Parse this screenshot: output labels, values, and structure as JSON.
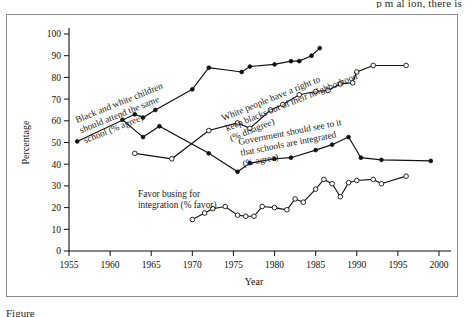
{
  "page": {
    "top_cutoff_text": "p      m  al    ion, there is",
    "bottom_cutoff_text": "Figure"
  },
  "figure": {
    "frame_label": "figure-frame"
  },
  "chart_data": {
    "type": "line",
    "title": "",
    "subtitle": "",
    "xlabel": "Year",
    "ylabel": "Percentage",
    "xlim": [
      1955,
      2000
    ],
    "ylim": [
      0,
      100
    ],
    "xticks": [
      "1955",
      "1960",
      "1965",
      "1970",
      "1975",
      "1980",
      "1985",
      "1990",
      "1995",
      "2000"
    ],
    "yticks": [
      "0",
      "10",
      "20",
      "30",
      "40",
      "50",
      "60",
      "70",
      "80",
      "90",
      "100"
    ],
    "grid": false,
    "legend_position": "inline-annotations",
    "series": [
      {
        "name": "Black and white children should attend the same school (% agree)",
        "label_line1": "Black and white children",
        "label_line2": "should attend the same",
        "label_line3": "school (% agree)",
        "marker": "filled-circle",
        "x": [
          1956,
          1963,
          1964,
          1965.5,
          1970,
          1972,
          1976,
          1977,
          1980,
          1982,
          1983,
          1984.5,
          1985.5
        ],
        "y": [
          50.5,
          63.0,
          61.5,
          65.0,
          74.5,
          84.5,
          82.5,
          85.0,
          86.0,
          87.5,
          87.5,
          90.0,
          93.5
        ]
      },
      {
        "name": "White people have a right to keep blacks out of their neighborhood (% disagree)",
        "label_line1": "White people have a right to",
        "label_line2": "keep blacks out of their neighborhood",
        "label_line3": "(% disagree)",
        "marker": "open-circle",
        "x": [
          1963,
          1967.5,
          1972,
          1975.5,
          1977,
          1979.5,
          1981,
          1983,
          1985,
          1986.5,
          1988,
          1989.5,
          1990,
          1992,
          1996
        ],
        "y": [
          45.0,
          42.5,
          55.5,
          59.0,
          56.5,
          65.0,
          67.5,
          72.0,
          73.5,
          74.0,
          77.0,
          77.5,
          82.5,
          85.5,
          85.5
        ]
      },
      {
        "name": "Government should see to it that schools are integrated (% agree)",
        "label_line1": "Government should see to it",
        "label_line2": "that schools are integrated",
        "label_line3": "(% agree)",
        "marker": "filled-circle",
        "x": [
          1961.5,
          1964,
          1966,
          1972,
          1975.5,
          1977,
          1980,
          1982,
          1985,
          1987,
          1989,
          1990.5,
          1993,
          1999
        ],
        "y": [
          60.5,
          52.5,
          57.5,
          45.0,
          36.5,
          40.5,
          42.5,
          43.0,
          46.5,
          49.0,
          52.5,
          43.0,
          42.0,
          41.5
        ]
      },
      {
        "name": "Favor busing for integration (% favor)",
        "label_line1": "Favor busing for",
        "label_line2": "integration (% favor)",
        "label_line3": "",
        "marker": "open-circle",
        "x": [
          1970,
          1971.5,
          1972.5,
          1974,
          1975.5,
          1976.5,
          1977.5,
          1978.5,
          1980,
          1981.5,
          1982.5,
          1983.5,
          1985,
          1986,
          1987,
          1988,
          1989,
          1990,
          1992,
          1993,
          1996
        ],
        "y": [
          14.5,
          17.5,
          19.5,
          20.5,
          16.5,
          16.0,
          16.0,
          20.5,
          20.0,
          19.0,
          24.0,
          22.5,
          28.5,
          33.0,
          31.0,
          25.0,
          31.5,
          32.5,
          33.0,
          31.0,
          34.5
        ]
      }
    ]
  }
}
